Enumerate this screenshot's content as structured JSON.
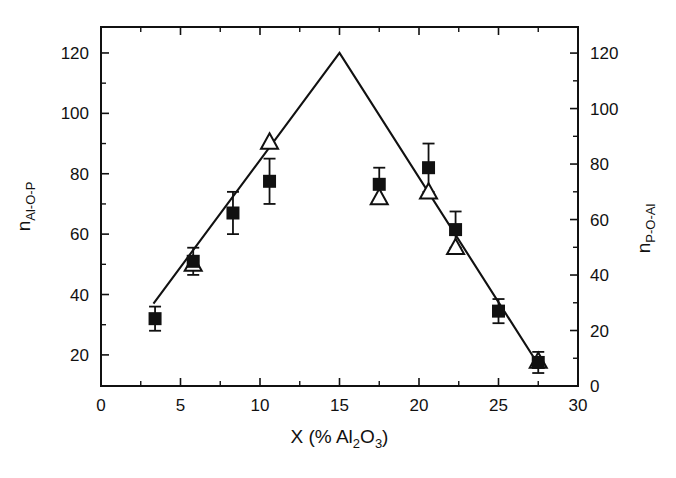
{
  "figure": {
    "background_color": "#ffffff",
    "ink_color": "#111111"
  },
  "chart_data": {
    "type": "scatter",
    "title": "",
    "xlabel": "X (% Al2O3)",
    "xlabel_parts": {
      "lead": "X (% Al",
      "sub1": "2",
      "mid": "O",
      "sub2": "3",
      "tail": ")"
    },
    "ylabel_left": "nAl-O-P",
    "ylabel_left_parts": {
      "base": "n",
      "sub": "Al-O-P"
    },
    "ylabel_right": "nP-O-Al",
    "ylabel_right_parts": {
      "base": "n",
      "sub": "P-O-Al"
    },
    "grid": false,
    "legend": "none",
    "xlim": [
      0,
      30
    ],
    "ylim_left": [
      9.7,
      128.6
    ],
    "ylim_right": [
      0,
      129.4
    ],
    "xticks": [
      0,
      5,
      10,
      15,
      20,
      25,
      30
    ],
    "xticklabels": [
      "0",
      "5",
      "10",
      "15",
      "20",
      "25",
      "30"
    ],
    "xminorticks": [
      2.5,
      7.5,
      12.5,
      17.5,
      22.5,
      27.5
    ],
    "yticks_left": [
      20,
      40,
      60,
      80,
      100,
      120
    ],
    "yticklabels_left": [
      "20",
      "40",
      "60",
      "80",
      "100",
      "120"
    ],
    "yminorticks_left": [
      30,
      50,
      70,
      90,
      110
    ],
    "yticks_right": [
      0,
      20,
      40,
      60,
      80,
      100,
      120
    ],
    "yticklabels_right": [
      "0",
      "20",
      "40",
      "60",
      "80",
      "100",
      "120"
    ],
    "yminorticks_right": [
      10,
      30,
      50,
      70,
      90,
      110
    ],
    "series": [
      {
        "name": "n_Al-O-P",
        "marker": "filled-square",
        "axis": "left",
        "points": [
          {
            "x": 3.4,
            "y": 32.0,
            "yerr": 4.0
          },
          {
            "x": 5.8,
            "y": 51.0,
            "yerr": 4.5
          },
          {
            "x": 8.3,
            "y": 67.0,
            "yerr": 7.0
          },
          {
            "x": 10.6,
            "y": 77.5,
            "yerr": 7.5
          },
          {
            "x": 17.5,
            "y": 76.5,
            "yerr": 5.5
          },
          {
            "x": 20.6,
            "y": 82.0,
            "yerr": 8.0
          },
          {
            "x": 22.3,
            "y": 61.5,
            "yerr": 6.0
          },
          {
            "x": 25.0,
            "y": 34.5,
            "yerr": 4.0
          },
          {
            "x": 27.5,
            "y": 17.5,
            "yerr": 3.5
          }
        ]
      },
      {
        "name": "n_P-O-Al",
        "marker": "open-triangle",
        "axis": "right",
        "points": [
          {
            "x": 5.8,
            "y": 44.0
          },
          {
            "x": 10.6,
            "y": 88.0
          },
          {
            "x": 17.5,
            "y": 68.0
          },
          {
            "x": 20.6,
            "y": 70.0
          },
          {
            "x": 22.3,
            "y": 50.0
          },
          {
            "x": 27.5,
            "y": 9.0
          }
        ]
      }
    ],
    "trend_line": {
      "name": "model-line",
      "axis": "left",
      "points": [
        {
          "x": 3.3,
          "y": 37.0
        },
        {
          "x": 15.0,
          "y": 120.0
        },
        {
          "x": 27.6,
          "y": 16.0
        }
      ]
    }
  }
}
